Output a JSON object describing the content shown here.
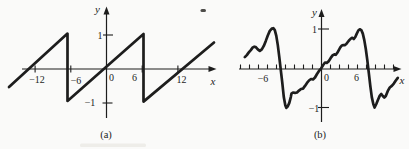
{
  "page": {
    "background": "#fafaf9",
    "ink": "#1d1d1d"
  },
  "chart_data": [
    {
      "id": "a",
      "type": "line",
      "caption": "(a)",
      "xlabel": "x",
      "ylabel": "y",
      "grid": false,
      "xlim": [
        -16.5,
        18.5
      ],
      "ylim": [
        -1.6,
        1.8
      ],
      "x_ticks": [
        {
          "value": -12,
          "label": "−12"
        },
        {
          "value": -6,
          "label": "−6"
        },
        {
          "value": 0,
          "label": "0"
        },
        {
          "value": 6,
          "label": "6"
        },
        {
          "value": 12,
          "label": "12"
        }
      ],
      "y_ticks": [
        {
          "value": 1,
          "label": "1"
        },
        {
          "value": -1,
          "label": "−1"
        }
      ],
      "series": [
        {
          "name": "sawtooth",
          "points": [
            [
              -16.39,
              -0.53
            ],
            [
              -6.55,
              1.04
            ],
            [
              -6.55,
              -0.94
            ],
            [
              6.22,
              1.03
            ],
            [
              6.22,
              -0.96
            ],
            [
              18.07,
              0.78
            ]
          ]
        }
      ],
      "layout": {
        "origin_px": [
          106.5,
          69
        ],
        "px_per_unit": [
          5.95,
          34
        ],
        "axis_width": 1.2,
        "curve_width": 2.7,
        "x_axis_px": [
          22,
          212
        ],
        "x_arrow_tip_px": [
          216.5,
          69
        ],
        "y_axis_px": [
          11,
          118
        ],
        "y_arrow_tip_px": [
          106.5,
          6.5
        ],
        "x_tick_style": "cross",
        "x_tick_half_len": 3.5,
        "x_label_pos": [
          [
            37,
            79.5
          ],
          [
            76,
            80
          ],
          [
            111.5,
            77.5
          ],
          [
            134.5,
            77
          ],
          [
            181.5,
            79.5
          ]
        ],
        "y_tick_px": [
          [
            103,
            113,
            35
          ],
          [
            102.5,
            112.5,
            103
          ]
        ],
        "y_label_pos": [
          [
            100,
            35.5
          ],
          [
            90,
            102.5
          ]
        ],
        "xlabel_pos": [
          213,
          80.5
        ],
        "ylabel_pos": [
          97.5,
          8.5
        ],
        "caption_pos": [
          106,
          134.5
        ]
      }
    },
    {
      "id": "b",
      "type": "line",
      "caption": "(b)",
      "xlabel": "x",
      "ylabel": "y",
      "grid": false,
      "xlim": [
        -9.2,
        9.0
      ],
      "ylim": [
        -1.55,
        1.55
      ],
      "x_ticks": [
        {
          "value": -6,
          "label": "−6"
        },
        {
          "value": 0,
          "label": "0"
        },
        {
          "value": 6,
          "label": "6"
        }
      ],
      "x_minor_ticks": [
        -9,
        -8,
        -7,
        -6,
        -5,
        -4,
        -3,
        -2,
        -1,
        1,
        2,
        3,
        4,
        5,
        6,
        7,
        8
      ],
      "y_ticks": [
        {
          "value": 1,
          "label": "1"
        },
        {
          "value": -1,
          "label": "−1"
        }
      ],
      "series": [
        {
          "name": "sawtooth-approximation",
          "points": [
            [
              -8.52,
              0.31
            ],
            [
              -8.3,
              0.36
            ],
            [
              -8.08,
              0.43
            ],
            [
              -7.86,
              0.49
            ],
            [
              -7.63,
              0.56
            ],
            [
              -7.47,
              0.58
            ],
            [
              -7.3,
              0.57
            ],
            [
              -7.08,
              0.51
            ],
            [
              -6.86,
              0.47
            ],
            [
              -6.63,
              0.51
            ],
            [
              -6.41,
              0.6
            ],
            [
              -6.19,
              0.73
            ],
            [
              -5.97,
              0.87
            ],
            [
              -5.74,
              0.99
            ],
            [
              -5.52,
              1.05
            ],
            [
              -5.36,
              1.06
            ],
            [
              -5.19,
              1.01
            ],
            [
              -5.02,
              0.86
            ],
            [
              -4.86,
              0.62
            ],
            [
              -4.69,
              0.31
            ],
            [
              -4.52,
              -0.03
            ],
            [
              -4.36,
              -0.36
            ],
            [
              -4.19,
              -0.73
            ],
            [
              -4.02,
              -0.94
            ],
            [
              -3.91,
              -1.01
            ],
            [
              -3.74,
              -0.97
            ],
            [
              -3.58,
              -0.88
            ],
            [
              -3.41,
              -0.73
            ],
            [
              -3.33,
              -0.64
            ],
            [
              -3.17,
              -0.61
            ],
            [
              -2.94,
              -0.62
            ],
            [
              -2.72,
              -0.61
            ],
            [
              -2.5,
              -0.56
            ],
            [
              -2.28,
              -0.52
            ],
            [
              -2.06,
              -0.51
            ],
            [
              -1.83,
              -0.44
            ],
            [
              -1.61,
              -0.36
            ],
            [
              -1.39,
              -0.3
            ],
            [
              -1.17,
              -0.26
            ],
            [
              -0.94,
              -0.27
            ],
            [
              -0.72,
              -0.22
            ],
            [
              -0.5,
              -0.13
            ],
            [
              -0.28,
              -0.05
            ],
            [
              -0.06,
              0.01
            ],
            [
              0.17,
              0.1
            ],
            [
              0.39,
              0.17
            ],
            [
              0.59,
              0.16
            ],
            [
              0.76,
              0.19
            ],
            [
              0.92,
              0.25
            ],
            [
              1.09,
              0.31
            ],
            [
              1.26,
              0.36
            ],
            [
              1.42,
              0.38
            ],
            [
              1.59,
              0.37
            ],
            [
              1.76,
              0.42
            ],
            [
              1.92,
              0.49
            ],
            [
              2.09,
              0.56
            ],
            [
              2.26,
              0.61
            ],
            [
              2.42,
              0.62
            ],
            [
              2.59,
              0.62
            ],
            [
              2.76,
              0.65
            ],
            [
              2.92,
              0.7
            ],
            [
              3.09,
              0.75
            ],
            [
              3.26,
              0.79
            ],
            [
              3.42,
              0.81
            ],
            [
              3.59,
              0.78
            ],
            [
              3.76,
              0.83
            ],
            [
              3.92,
              0.92
            ],
            [
              4.09,
              1.0
            ],
            [
              4.26,
              1.03
            ],
            [
              4.42,
              1.01
            ],
            [
              4.59,
              0.92
            ],
            [
              4.76,
              0.75
            ],
            [
              4.92,
              0.52
            ],
            [
              5.09,
              0.23
            ],
            [
              5.26,
              -0.1
            ],
            [
              5.42,
              -0.44
            ],
            [
              5.59,
              -0.73
            ],
            [
              5.76,
              -0.91
            ],
            [
              5.9,
              -1.0
            ],
            [
              6.09,
              -0.91
            ],
            [
              6.26,
              -0.81
            ],
            [
              6.48,
              -0.69
            ],
            [
              6.64,
              -0.65
            ],
            [
              6.81,
              -0.7
            ],
            [
              6.98,
              -0.74
            ],
            [
              7.14,
              -0.7
            ],
            [
              7.37,
              -0.57
            ],
            [
              7.59,
              -0.48
            ],
            [
              7.81,
              -0.44
            ],
            [
              8.03,
              -0.38
            ],
            [
              8.26,
              -0.3
            ],
            [
              8.48,
              -0.23
            ]
          ]
        }
      ],
      "layout": {
        "origin_px": [
          321.5,
          69
        ],
        "px_per_unit": [
          9,
          38.5
        ],
        "axis_width": 1.2,
        "curve_width": 2.7,
        "x_axis_px": [
          239,
          397
        ],
        "x_arrow_tip_px": [
          401.5,
          69
        ],
        "y_axis_px": [
          13,
          122
        ],
        "y_arrow_tip_px": [
          321.5,
          9
        ],
        "x_tick_style": "up",
        "x_minor_tick_len": 4.5,
        "x_label_pos": [
          [
            263,
            78
          ],
          [
            326.5,
            77
          ],
          [
            356.5,
            77.5
          ]
        ],
        "y_tick_px": [
          [
            318,
            329,
            29
          ],
          [
            318,
            329,
            107.5
          ]
        ],
        "y_label_pos": [
          [
            314.5,
            29
          ],
          [
            314,
            108.5
          ]
        ],
        "xlabel_pos": [
          402,
          79.5
        ],
        "ylabel_pos": [
          314.5,
          11.5
        ],
        "caption_pos": [
          320,
          134
        ]
      }
    }
  ],
  "artifacts": [
    {
      "x": 200.5,
      "y": 9,
      "w": 5.5,
      "h": 3,
      "fill": "#2f2e2c",
      "opacity": 0.85
    },
    {
      "x": 80,
      "y": 143.5,
      "w": 66,
      "h": 3.5,
      "fill": "#ecebe7",
      "opacity": 0.9
    }
  ]
}
